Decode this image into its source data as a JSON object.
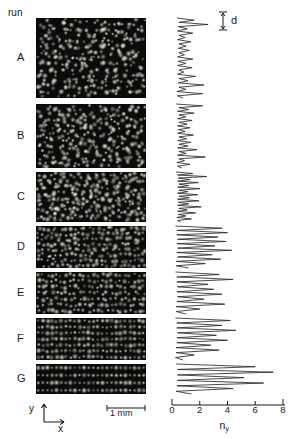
{
  "figure": {
    "column_header": "run",
    "scalebar_label": "1 mm",
    "spacing_label": "d",
    "axis_x_label_text": "n",
    "axis_x_label_sub": "y",
    "axis_indicator_y": "y",
    "axis_indicator_x": "x",
    "colors": {
      "ink": "#1a1a1a",
      "panel_background": "#0b0b0b",
      "particle": "#e8e4d8",
      "trace": "#2a2a2a",
      "page": "#ffffff"
    }
  },
  "chart_data": {
    "type": "line",
    "title": "",
    "xlabel": "n_y",
    "ylabel": "y",
    "xlim": [
      0,
      8
    ],
    "ticks": [
      0,
      2,
      4,
      6,
      8
    ],
    "tick_labels": [
      "0",
      "2",
      "4",
      "6",
      "8"
    ],
    "grid": false,
    "legend": null,
    "orientation": "horizontal-profiles",
    "series": [
      {
        "name": "A",
        "run": "A",
        "peak_count": 18,
        "max_n_y": 2.6,
        "ordering": "disordered",
        "values": [
          0.35,
          1.6,
          0.5,
          2.6,
          0.45,
          1.1,
          0.4,
          1.5,
          0.5,
          0.95,
          0.4,
          1.35,
          0.5,
          1.0,
          0.45,
          1.25,
          0.5,
          0.9,
          0.4,
          1.5,
          0.45,
          1.0,
          0.4,
          1.45,
          0.5,
          0.85,
          0.4,
          1.7,
          0.5,
          1.15,
          0.45,
          2.3,
          0.5,
          1.0,
          0.35,
          2.2,
          0.4,
          0.8
        ]
      },
      {
        "name": "B",
        "run": "B",
        "peak_count": 16,
        "max_n_y": 2.4,
        "ordering": "disordered",
        "values": [
          0.3,
          2.2,
          0.5,
          1.2,
          0.4,
          1.6,
          0.5,
          1.0,
          0.4,
          1.45,
          0.5,
          1.1,
          0.4,
          1.3,
          0.45,
          0.95,
          0.4,
          1.55,
          0.5,
          1.05,
          0.4,
          1.35,
          0.5,
          1.15,
          0.4,
          1.8,
          0.5,
          1.0,
          0.4,
          2.4,
          0.5,
          0.9,
          0.35,
          1.3,
          0.4,
          0.7
        ]
      },
      {
        "name": "C",
        "run": "C",
        "peak_count": 15,
        "max_n_y": 2.5,
        "ordering": "partially-ordered",
        "values": [
          0.3,
          1.5,
          0.4,
          2.5,
          0.45,
          1.3,
          0.4,
          1.9,
          0.5,
          1.2,
          0.4,
          2.0,
          0.5,
          1.15,
          0.4,
          1.85,
          0.5,
          1.25,
          0.4,
          1.95,
          0.45,
          1.2,
          0.4,
          2.1,
          0.5,
          1.1,
          0.4,
          1.7,
          0.45,
          1.0,
          0.35,
          1.4,
          0.4,
          0.6
        ]
      },
      {
        "name": "D",
        "run": "D",
        "peak_count": 9,
        "max_n_y": 4.3,
        "ordering": "layered",
        "values": [
          0.25,
          3.6,
          0.35,
          4.0,
          0.35,
          3.3,
          0.4,
          3.9,
          0.35,
          3.1,
          0.4,
          4.3,
          0.35,
          2.9,
          0.4,
          3.5,
          0.3,
          2.4,
          0.3,
          1.2
        ]
      },
      {
        "name": "E",
        "run": "E",
        "peak_count": 8,
        "max_n_y": 4.4,
        "ordering": "layered",
        "values": [
          0.25,
          3.4,
          0.35,
          4.4,
          0.35,
          2.6,
          0.4,
          3.0,
          0.35,
          3.6,
          0.4,
          2.3,
          0.35,
          3.8,
          0.3,
          2.0,
          0.3,
          1.0
        ]
      },
      {
        "name": "F",
        "run": "F",
        "peak_count": 8,
        "max_n_y": 4.6,
        "ordering": "layered",
        "values": [
          0.25,
          4.2,
          0.35,
          3.6,
          0.35,
          4.6,
          0.4,
          3.2,
          0.35,
          4.0,
          0.35,
          2.8,
          0.3,
          3.4,
          0.3,
          1.6,
          0.25,
          0.8
        ]
      },
      {
        "name": "G",
        "run": "G",
        "peak_count": 5,
        "max_n_y": 7.3,
        "ordering": "strongly-layered",
        "values": [
          0.3,
          6.0,
          0.4,
          7.3,
          0.4,
          5.2,
          0.4,
          6.6,
          0.35,
          4.4,
          0.3,
          1.4
        ]
      }
    ]
  },
  "runs": [
    {
      "id": "A",
      "label": "A",
      "panel_rows": 14,
      "panel_order": 0.1
    },
    {
      "id": "B",
      "label": "B",
      "panel_rows": 12,
      "panel_order": 0.22
    },
    {
      "id": "C",
      "label": "C",
      "panel_rows": 11,
      "panel_order": 0.38
    },
    {
      "id": "D",
      "label": "D",
      "panel_rows": 8,
      "panel_order": 0.62
    },
    {
      "id": "E",
      "label": "E",
      "panel_rows": 7,
      "panel_order": 0.72
    },
    {
      "id": "F",
      "label": "F",
      "panel_rows": 7,
      "panel_order": 0.86
    },
    {
      "id": "G",
      "label": "G",
      "panel_rows": 4,
      "panel_order": 0.97
    }
  ]
}
